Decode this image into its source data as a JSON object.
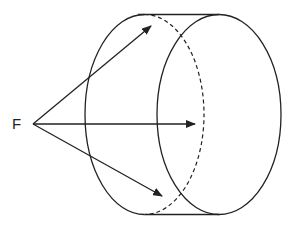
{
  "diagram": {
    "labels": {
      "point": "F"
    },
    "colors": {
      "stroke": "#222222",
      "background": "#ffffff"
    },
    "point_F": {
      "x": 33,
      "y": 124
    },
    "cylinder": {
      "front_ellipse": {
        "cx": 144.5,
        "cy": 114.5,
        "rx": 59.5,
        "ry": 100,
        "back_half": "dashed"
      },
      "rear_ellipse": {
        "cx": 219,
        "cy": 114.5,
        "rx": 62,
        "ry": 100
      },
      "top_edge_y": 14.5,
      "bottom_edge_y": 214.5
    },
    "arrows": [
      {
        "name": "upper",
        "from": [
          33,
          124
        ],
        "to": [
          151,
          26
        ]
      },
      {
        "name": "middle",
        "from": [
          33,
          124
        ],
        "to": [
          195,
          124
        ]
      },
      {
        "name": "lower",
        "from": [
          33,
          124
        ],
        "to": [
          162,
          196
        ]
      }
    ]
  }
}
